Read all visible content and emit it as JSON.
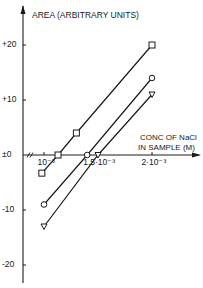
{
  "chart_data": {
    "type": "line",
    "title": "",
    "ylabel": "AREA (ARBITRARY UNITS)",
    "xlabel_line1": "CONC OF NaCl",
    "xlabel_line2": "IN SAMPLE (M)",
    "ylim": [
      -22,
      24
    ],
    "xlim": [
      0.0008,
      0.00235
    ],
    "grid": false,
    "legend": "none",
    "y_ticks": [
      {
        "value": 20,
        "label": "+20"
      },
      {
        "value": 10,
        "label": "+10"
      },
      {
        "value": 0,
        "label": "±0"
      },
      {
        "value": -10,
        "label": "-10"
      },
      {
        "value": -20,
        "label": "-20"
      }
    ],
    "x_ticks": [
      {
        "value": 0.001,
        "label": "10⁻³"
      },
      {
        "value": 0.0015,
        "label": "1.5·10⁻³"
      },
      {
        "value": 0.002,
        "label": "2·10⁻³"
      }
    ],
    "x_axis_break": true,
    "series": [
      {
        "name": "squares",
        "marker": "square",
        "x": [
          0.00098,
          0.00113,
          0.0013,
          0.002
        ],
        "y": [
          -3.3,
          0,
          4,
          20
        ]
      },
      {
        "name": "circles",
        "marker": "circle",
        "x": [
          0.001,
          0.0014,
          0.002
        ],
        "y": [
          -9,
          0,
          14
        ]
      },
      {
        "name": "triangles",
        "marker": "triangle-down",
        "x": [
          0.001,
          0.0015,
          0.002
        ],
        "y": [
          -13,
          0,
          11
        ]
      }
    ]
  }
}
